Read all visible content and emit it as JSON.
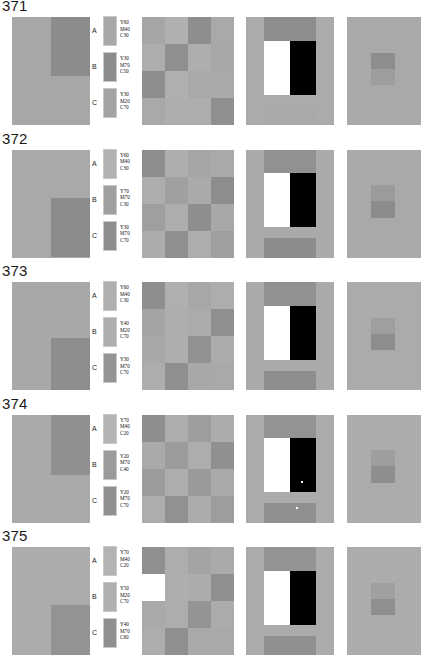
{
  "page": {
    "background": "#ffffff",
    "width": 429,
    "height": 664
  },
  "rows": [
    {
      "number": "371",
      "legend": [
        {
          "letter": "A",
          "line1": "Y60",
          "line2": "M40",
          "line3": "C30",
          "swatch": "#a8a8a8"
        },
        {
          "letter": "B",
          "line1": "Y30",
          "line2": "M70",
          "line3": "C50",
          "swatch": "#8c8c8c"
        },
        {
          "letter": "C",
          "line1": "Y30",
          "line2": "M20",
          "line3": "C70",
          "swatch": "#a3a3a3"
        }
      ],
      "panel1": {
        "bg": "#a7a7a7",
        "block_color": "#8c8c8c",
        "block_top_pct": 0,
        "block_height_pct": 55
      },
      "panel2": {
        "cells": [
          "#a5a5a5",
          "#b0b0b0",
          "#8e8e8e",
          "#a9a9a9",
          "#adadad",
          "#8f8f8f",
          "#aeaeae",
          "#a8a8a8",
          "#8e8e8e",
          "#b0b0b0",
          "#a9a9a9",
          "#aaaaaa",
          "#a9a9a9",
          "#aeaeae",
          "#adadad",
          "#8f8f8f"
        ]
      },
      "panel3": {
        "bg": "#ababab",
        "topband": "#8d8d8d",
        "botband": "#a9a9a9",
        "specks": []
      },
      "panel4": {
        "bg": "#a9a9a9",
        "patch_top": "#8e8e8e",
        "patch_bottom": "#9d9d9d"
      }
    },
    {
      "number": "372",
      "legend": [
        {
          "letter": "A",
          "line1": "Y60",
          "line2": "M40",
          "line3": "C30",
          "swatch": "#b2b2b2"
        },
        {
          "letter": "B",
          "line1": "Y70",
          "line2": "M70",
          "line3": "C30",
          "swatch": "#a0a0a0"
        },
        {
          "letter": "C",
          "line1": "Y30",
          "line2": "M70",
          "line3": "C70",
          "swatch": "#8e8e8e"
        }
      ],
      "panel1": {
        "bg": "#a9a9a9",
        "block_color": "#8b8b8b",
        "block_top_pct": 45,
        "block_height_pct": 55
      },
      "panel2": {
        "cells": [
          "#8d8d8d",
          "#aeaeae",
          "#a5a5a5",
          "#a9a9a9",
          "#aeaeae",
          "#a0a0a0",
          "#aaaaaa",
          "#8d8d8d",
          "#9f9f9f",
          "#adadad",
          "#8e8e8e",
          "#a8a8a8",
          "#acacac",
          "#909090",
          "#adadad",
          "#9f9f9f"
        ]
      },
      "panel3": {
        "bg": "#aaaaaa",
        "topband": "#919191",
        "botband": "#8c8c8c",
        "specks": []
      },
      "panel4": {
        "bg": "#a9a9a9",
        "patch_top": "#9b9b9b",
        "patch_bottom": "#8c8c8c"
      }
    },
    {
      "number": "373",
      "legend": [
        {
          "letter": "A",
          "line1": "Y60",
          "line2": "M40",
          "line3": "C30",
          "swatch": "#b0b0b0"
        },
        {
          "letter": "B",
          "line1": "Y40",
          "line2": "M20",
          "line3": "C70",
          "swatch": "#aeaeae"
        },
        {
          "letter": "C",
          "line1": "Y30",
          "line2": "M70",
          "line3": "C70",
          "swatch": "#949494"
        }
      ],
      "panel1": {
        "bg": "#a8a8a8",
        "block_color": "#8d8d8d",
        "block_top_pct": 52,
        "block_height_pct": 48
      },
      "panel2": {
        "cells": [
          "#8e8e8e",
          "#afafaf",
          "#a7a7a7",
          "#adadad",
          "#a4a4a4",
          "#aeaeae",
          "#ababab",
          "#8f8f8f",
          "#a8a8a8",
          "#aeaeae",
          "#919191",
          "#acacac",
          "#adadad",
          "#8f8f8f",
          "#a8a8a8",
          "#a9a9a9"
        ]
      },
      "panel3": {
        "bg": "#aaaaaa",
        "topband": "#919191",
        "botband": "#8e8e8e",
        "specks": []
      },
      "panel4": {
        "bg": "#ababab",
        "patch_top": "#9f9f9f",
        "patch_bottom": "#8d8d8d"
      }
    },
    {
      "number": "374",
      "legend": [
        {
          "letter": "A",
          "line1": "Y70",
          "line2": "M40",
          "line3": "C20",
          "swatch": "#b4b4b4"
        },
        {
          "letter": "B",
          "line1": "Y20",
          "line2": "M70",
          "line3": "C40",
          "swatch": "#9b9b9b"
        },
        {
          "letter": "C",
          "line1": "Y20",
          "line2": "M70",
          "line3": "C70",
          "swatch": "#909090"
        }
      ],
      "panel1": {
        "bg": "#aaaaaa",
        "block_color": "#909090",
        "block_top_pct": 0,
        "block_height_pct": 56
      },
      "panel2": {
        "cells": [
          "#8e8e8e",
          "#adadad",
          "#9d9d9d",
          "#acacac",
          "#aaaaaa",
          "#9c9c9c",
          "#adadad",
          "#909090",
          "#9c9c9c",
          "#adadad",
          "#9a9a9a",
          "#aaaaaa",
          "#adadad",
          "#919191",
          "#acacac",
          "#9d9d9d"
        ]
      },
      "panel3": {
        "bg": "#ababab",
        "topband": "#939393",
        "botband": "#8f8f8f",
        "specks": [
          {
            "left": "63%",
            "top": "62%"
          },
          {
            "left": "57%",
            "top": "86%"
          }
        ]
      },
      "panel4": {
        "bg": "#acacac",
        "patch_top": "#9e9e9e",
        "patch_bottom": "#8e8e8e"
      }
    },
    {
      "number": "375",
      "legend": [
        {
          "letter": "A",
          "line1": "Y70",
          "line2": "M40",
          "line3": "C20",
          "swatch": "#b3b3b3"
        },
        {
          "letter": "B",
          "line1": "Y50",
          "line2": "M20",
          "line3": "C70",
          "swatch": "#b0b0b0"
        },
        {
          "letter": "C",
          "line1": "Y40",
          "line2": "M70",
          "line3": "C60",
          "swatch": "#8f8f8f"
        }
      ],
      "panel1": {
        "bg": "#acacac",
        "block_color": "#939393",
        "block_top_pct": 54,
        "block_height_pct": 46
      },
      "panel2": {
        "cells": [
          "#8f8f8f",
          "#adadad",
          "#a4a4a4",
          "#aaaaaa",
          "#abababb",
          "#aeaeae",
          "#acacac",
          "#8f8f8f",
          "#a9a9a9",
          "#adadad",
          "#949494",
          "#ababab",
          "#adadad",
          "#8f8f8f",
          "#a9a9a9",
          "#a9a9a9"
        ]
      },
      "panel3": {
        "bg": "#ababab",
        "topband": "#949494",
        "botband": "#8f8f8f",
        "specks": []
      },
      "panel4": {
        "bg": "#acacac",
        "patch_top": "#a0a0a0",
        "patch_bottom": "#8f8f8f"
      }
    }
  ]
}
